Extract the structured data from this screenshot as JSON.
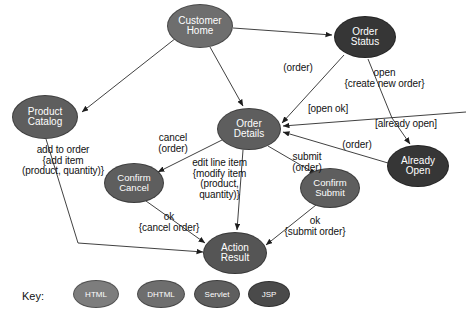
{
  "diagram": {
    "palette": {
      "html": "#7d7d7d",
      "dhtml": "#6e6e6e",
      "servlet": "#5e5e5e",
      "jsp": "#363636",
      "edge": "#2b2b2b",
      "text": "#111111"
    },
    "nodes": [
      {
        "id": "customer-home",
        "label_line1": "Customer",
        "label_line2": "Home",
        "type": "dhtml",
        "cx": 200,
        "cy": 26,
        "rx": 33,
        "ry": 22,
        "fill": "#6e6e6e",
        "font": 10
      },
      {
        "id": "order-status",
        "label_line1": "Order",
        "label_line2": "Status",
        "type": "jsp",
        "cx": 365,
        "cy": 37,
        "rx": 31,
        "ry": 21,
        "fill": "#363636",
        "font": 10
      },
      {
        "id": "product-catalog",
        "label_line1": "Product",
        "label_line2": "Catalog",
        "type": "servlet",
        "cx": 45,
        "cy": 117,
        "rx": 33,
        "ry": 22,
        "fill": "#5e5e5e",
        "font": 10
      },
      {
        "id": "order-details",
        "label_line1": "Order",
        "label_line2": "Details",
        "type": "servlet",
        "cx": 249,
        "cy": 129,
        "rx": 32,
        "ry": 21,
        "fill": "#5e5e5e",
        "font": 10
      },
      {
        "id": "already-open",
        "label_line1": "Already",
        "label_line2": "Open",
        "type": "jsp",
        "cx": 418,
        "cy": 166,
        "rx": 31,
        "ry": 21,
        "fill": "#363636",
        "font": 10
      },
      {
        "id": "confirm-cancel",
        "label_line1": "Confirm",
        "label_line2": "Cancel",
        "type": "servlet",
        "cx": 134,
        "cy": 183,
        "rx": 30,
        "ry": 20,
        "fill": "#5e5e5e",
        "font": 9.5
      },
      {
        "id": "confirm-submit",
        "label_line1": "Confirm",
        "label_line2": "Submit",
        "type": "servlet",
        "cx": 330,
        "cy": 188,
        "rx": 30,
        "ry": 20,
        "fill": "#5e5e5e",
        "font": 9.5
      },
      {
        "id": "action-result",
        "label_line1": "Action",
        "label_line2": "Result",
        "type": "servlet",
        "cx": 235,
        "cy": 253,
        "rx": 32,
        "ry": 21,
        "fill": "#555555",
        "font": 10
      }
    ],
    "edges": [
      {
        "id": "home-to-catalog",
        "from": "customer-home",
        "to": "product-catalog",
        "label": ""
      },
      {
        "id": "home-to-details",
        "from": "customer-home",
        "to": "order-details",
        "label": ""
      },
      {
        "id": "home-to-status",
        "from": "customer-home",
        "to": "order-status",
        "label": ""
      },
      {
        "id": "status-to-details",
        "from": "order-status",
        "to": "order-details",
        "label": "(order)"
      },
      {
        "id": "status-to-already-open",
        "from": "order-status",
        "to": "already-open",
        "label": "open\n{create new order}"
      },
      {
        "id": "already-open-branch",
        "from": "order-status",
        "to": "already-open",
        "label": "[already open]"
      },
      {
        "id": "open-ok-to-details",
        "from": "order-status",
        "to": "order-details",
        "label": "[open ok]"
      },
      {
        "id": "already-open-to-details",
        "from": "already-open",
        "to": "order-details",
        "label": "(order)"
      },
      {
        "id": "catalog-to-result",
        "from": "product-catalog",
        "to": "action-result",
        "label": "add to order\n{add item\n(product, quantity)}"
      },
      {
        "id": "details-to-cancel",
        "from": "order-details",
        "to": "confirm-cancel",
        "label": "cancel\n(order)"
      },
      {
        "id": "details-to-result",
        "from": "order-details",
        "to": "action-result",
        "label": "edit line item\n{modify item\n(product,\nquantity)}"
      },
      {
        "id": "details-to-submit",
        "from": "order-details",
        "to": "confirm-submit",
        "label": "submit\n(order)"
      },
      {
        "id": "cancel-to-result",
        "from": "confirm-cancel",
        "to": "action-result",
        "label": "ok\n{cancel order}"
      },
      {
        "id": "submit-to-result",
        "from": "confirm-submit",
        "to": "action-result",
        "label": "ok\n{submit order}"
      }
    ],
    "edge_labels": [
      {
        "id": "label-order-top",
        "text": "(order)",
        "x": 268,
        "y": 63,
        "w": 60,
        "size": 10
      },
      {
        "id": "label-open-create",
        "text": "open\n{create new order}",
        "x": 322,
        "y": 68,
        "w": 125,
        "size": 10
      },
      {
        "id": "label-open-ok",
        "text": "[open ok]",
        "x": 293,
        "y": 104,
        "w": 70,
        "size": 10
      },
      {
        "id": "label-already-open",
        "text": "[already open]",
        "x": 356,
        "y": 119,
        "w": 100,
        "size": 10
      },
      {
        "id": "label-order-right",
        "text": "(order)",
        "x": 327,
        "y": 140,
        "w": 60,
        "size": 10
      },
      {
        "id": "label-add-to-order",
        "text": "add to order\n{add item\n(product, quantity)}",
        "x": 2,
        "y": 145,
        "w": 122,
        "size": 10
      },
      {
        "id": "label-cancel-order",
        "text": "cancel\n(order)",
        "x": 144,
        "y": 133,
        "w": 58,
        "size": 10
      },
      {
        "id": "label-edit-line-item",
        "text": "edit line item\n{modify item\n(product,\nquantity)}",
        "x": 167,
        "y": 158,
        "w": 105,
        "size": 10
      },
      {
        "id": "label-submit-order",
        "text": "submit\n(order)",
        "x": 278,
        "y": 152,
        "w": 58,
        "size": 10
      },
      {
        "id": "label-ok-cancel-order",
        "text": "ok\n{cancel order}",
        "x": 124,
        "y": 212,
        "w": 90,
        "size": 10
      },
      {
        "id": "label-ok-submit-order",
        "text": "ok\n{submit order}",
        "x": 268,
        "y": 216,
        "w": 94,
        "size": 10
      }
    ],
    "key": {
      "label": "Key:",
      "label_x": 22,
      "label_y": 290,
      "items": [
        {
          "id": "key-html",
          "label": "HTML",
          "type": "html",
          "cx": 95,
          "cy": 293,
          "rx": 22,
          "ry": 13,
          "fill": "#7d7d7d"
        },
        {
          "id": "key-dhtml",
          "label": "DHTML",
          "type": "dhtml",
          "cx": 160,
          "cy": 293,
          "rx": 23,
          "ry": 13,
          "fill": "#6e6e6e"
        },
        {
          "id": "key-servlet",
          "label": "Servlet",
          "type": "servlet",
          "cx": 216,
          "cy": 293,
          "rx": 22,
          "ry": 13,
          "fill": "#5e5e5e"
        },
        {
          "id": "key-jsp",
          "label": "JSP",
          "type": "jsp",
          "cx": 268,
          "cy": 293,
          "rx": 20,
          "ry": 12,
          "fill": "#4a4a4a"
        }
      ]
    }
  }
}
